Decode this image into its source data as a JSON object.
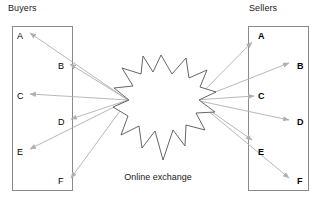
{
  "diagram": {
    "caption": "Online exchange",
    "buyers": {
      "header": "Buyers",
      "nodes": [
        {
          "id": "buyer-a",
          "label": "A",
          "side": "left",
          "x": 17,
          "y": 31
        },
        {
          "id": "buyer-b",
          "label": "B",
          "side": "right",
          "x": 58,
          "y": 61
        },
        {
          "id": "buyer-c",
          "label": "C",
          "side": "left",
          "x": 17,
          "y": 91
        },
        {
          "id": "buyer-d",
          "label": "D",
          "side": "right",
          "x": 58,
          "y": 117
        },
        {
          "id": "buyer-e",
          "label": "E",
          "side": "left",
          "x": 17,
          "y": 147
        },
        {
          "id": "buyer-f",
          "label": "F",
          "side": "right",
          "x": 58,
          "y": 176
        }
      ],
      "box": {
        "x": 12,
        "y": 26,
        "w": 60,
        "h": 164
      }
    },
    "sellers": {
      "header": "Sellers",
      "nodes": [
        {
          "id": "seller-a",
          "label": "A",
          "side": "in",
          "x": 258,
          "y": 31
        },
        {
          "id": "seller-b",
          "label": "B",
          "side": "out",
          "x": 297,
          "y": 61
        },
        {
          "id": "seller-c",
          "label": "C",
          "side": "in",
          "x": 258,
          "y": 91
        },
        {
          "id": "seller-d",
          "label": "D",
          "side": "out",
          "x": 297,
          "y": 117
        },
        {
          "id": "seller-e",
          "label": "E",
          "side": "in",
          "x": 258,
          "y": 147
        },
        {
          "id": "seller-f",
          "label": "F",
          "side": "out",
          "x": 297,
          "y": 176
        }
      ],
      "box": {
        "x": 248,
        "y": 26,
        "w": 60,
        "h": 164
      }
    },
    "hub": {
      "name": "online-exchange-burst",
      "left_port": {
        "x": 128,
        "y": 100
      },
      "right_port": {
        "x": 195,
        "y": 100
      },
      "points": "161,55 172,74 186,58 189,78 207,70 200,87 216,92 199,100 215,112 196,113 205,130 186,125 185,146 173,130 163,160 155,131 142,148 139,126 121,135 128,116 113,107 129,100 114,88 133,86 122,68 141,74 143,56 153,72"
    },
    "edges": {
      "buyer_links": [
        {
          "id": "edge-hub-buyer-a",
          "from": "hub-left",
          "to": "buyer-a",
          "x1": 128,
          "y1": 100,
          "x2": 30,
          "y2": 33
        },
        {
          "id": "edge-hub-buyer-b",
          "from": "hub-left",
          "to": "buyer-b",
          "x1": 128,
          "y1": 100,
          "x2": 70,
          "y2": 64
        },
        {
          "id": "edge-hub-buyer-c",
          "from": "hub-left",
          "to": "buyer-c",
          "x1": 128,
          "y1": 100,
          "x2": 30,
          "y2": 94
        },
        {
          "id": "edge-hub-buyer-d",
          "from": "hub-left",
          "to": "buyer-d",
          "x1": 128,
          "y1": 100,
          "x2": 71,
          "y2": 119
        },
        {
          "id": "edge-hub-buyer-e",
          "from": "hub-left",
          "to": "buyer-e",
          "x1": 128,
          "y1": 100,
          "x2": 30,
          "y2": 149
        },
        {
          "id": "edge-hub-buyer-f",
          "from": "hub-left",
          "to": "buyer-f",
          "x1": 128,
          "y1": 100,
          "x2": 71,
          "y2": 178
        }
      ],
      "seller_links": [
        {
          "id": "edge-hub-seller-a",
          "from": "hub-right",
          "to": "seller-a",
          "x1": 195,
          "y1": 100,
          "x2": 252,
          "y2": 42
        },
        {
          "id": "edge-hub-seller-b",
          "from": "hub-right",
          "to": "seller-b",
          "x1": 195,
          "y1": 100,
          "x2": 289,
          "y2": 63
        },
        {
          "id": "edge-hub-seller-c",
          "from": "hub-right",
          "to": "seller-c",
          "x1": 195,
          "y1": 100,
          "x2": 254,
          "y2": 96
        },
        {
          "id": "edge-hub-seller-d",
          "from": "hub-right",
          "to": "seller-d",
          "x1": 195,
          "y1": 100,
          "x2": 289,
          "y2": 120
        },
        {
          "id": "edge-hub-seller-e",
          "from": "hub-right",
          "to": "seller-e",
          "x1": 195,
          "y1": 100,
          "x2": 252,
          "y2": 140
        },
        {
          "id": "edge-hub-seller-f",
          "from": "hub-right",
          "to": "seller-f",
          "x1": 195,
          "y1": 100,
          "x2": 289,
          "y2": 178
        }
      ]
    },
    "colors": {
      "arrow": "#b0b0b0",
      "box_border": "#8a8a8a",
      "burst_stroke": "#555555",
      "text": "#000000",
      "background": "#ffffff"
    }
  }
}
